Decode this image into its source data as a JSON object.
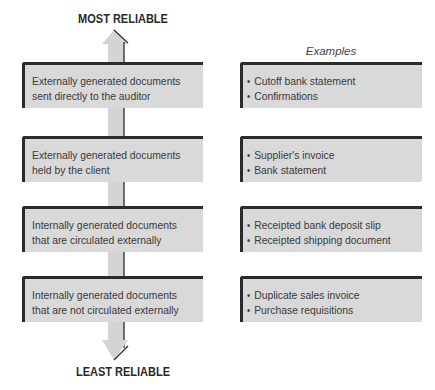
{
  "diagram": {
    "top_label": "MOST RELIABLE",
    "bottom_label": "LEAST RELIABLE",
    "examples_heading": "Examples",
    "levels": [
      {
        "line1": "Externally generated documents",
        "line2": "sent directly to the auditor",
        "examples": [
          "Cutoff bank statement",
          "Confirmations"
        ]
      },
      {
        "line1": "Externally generated documents",
        "line2": "held by the client",
        "examples": [
          "Supplier's invoice",
          "Bank statement"
        ]
      },
      {
        "line1": "Internally generated documents",
        "line2": "that are circulated externally",
        "examples": [
          "Receipted bank deposit slip",
          "Receipted shipping document"
        ]
      },
      {
        "line1": "Internally generated documents",
        "line2": "that are not circulated externally",
        "examples": [
          "Duplicate sales invoice",
          "Purchase requisitions"
        ]
      }
    ],
    "colors": {
      "box_fill": "#d9d9d9",
      "border_dark": "#2b2b2b",
      "arrow_fill": "#d4d4d4",
      "text": "#3a3a3a"
    }
  }
}
